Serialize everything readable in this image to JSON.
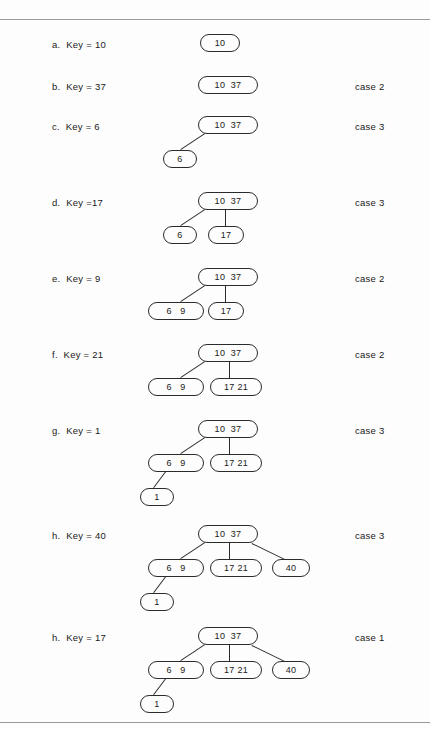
{
  "figure": {
    "type": "2-3-tree-insertion-sequence",
    "background_color": "#fdfdfd",
    "line_color": "#2b2b2b",
    "rule_color": "#9a9a9a"
  },
  "steps": [
    {
      "id": "a",
      "label": "a.  Key = 10",
      "case": "",
      "key": "10",
      "nodes": [
        {
          "name": "root",
          "text": "10",
          "x": 200,
          "y": 34,
          "w": 40
        }
      ],
      "edges": []
    },
    {
      "id": "b",
      "label": "b.  Key = 37",
      "case": "case 2",
      "key": "37",
      "nodes": [
        {
          "name": "root",
          "text": "10  37",
          "x": 198,
          "y": 76,
          "w": 60
        }
      ],
      "edges": []
    },
    {
      "id": "c",
      "label": "c.  Key = 6",
      "case": "case 3",
      "key": "6",
      "nodes": [
        {
          "name": "root",
          "text": "10  37",
          "x": 198,
          "y": 116,
          "w": 60
        },
        {
          "name": "child-left",
          "text": "6",
          "x": 163,
          "y": 150,
          "w": 34
        }
      ],
      "edges": [
        {
          "x1": 205,
          "y1": 134,
          "x2": 181,
          "y2": 150
        }
      ]
    },
    {
      "id": "d",
      "label": "d.  Key =17",
      "case": "case 3",
      "key": "17",
      "nodes": [
        {
          "name": "root",
          "text": "10  37",
          "x": 198,
          "y": 192,
          "w": 60
        },
        {
          "name": "child-left",
          "text": "6",
          "x": 163,
          "y": 226,
          "w": 34
        },
        {
          "name": "child-middle",
          "text": "17",
          "x": 208,
          "y": 226,
          "w": 36
        }
      ],
      "edges": [
        {
          "x1": 205,
          "y1": 210,
          "x2": 181,
          "y2": 226
        },
        {
          "x1": 226,
          "y1": 210,
          "x2": 226,
          "y2": 226
        }
      ]
    },
    {
      "id": "e",
      "label": "e.  Key = 9",
      "case": "case 2",
      "key": "9",
      "nodes": [
        {
          "name": "root",
          "text": "10  37",
          "x": 198,
          "y": 268,
          "w": 60
        },
        {
          "name": "child-left",
          "text": "6   9",
          "x": 148,
          "y": 302,
          "w": 56
        },
        {
          "name": "child-middle",
          "text": "17",
          "x": 208,
          "y": 302,
          "w": 36
        }
      ],
      "edges": [
        {
          "x1": 205,
          "y1": 286,
          "x2": 181,
          "y2": 302
        },
        {
          "x1": 226,
          "y1": 286,
          "x2": 226,
          "y2": 302
        }
      ]
    },
    {
      "id": "f",
      "label": "f.  Key = 21",
      "case": "case 2",
      "key": "21",
      "nodes": [
        {
          "name": "root",
          "text": "10  37",
          "x": 198,
          "y": 344,
          "w": 60
        },
        {
          "name": "child-left",
          "text": "6   9",
          "x": 148,
          "y": 378,
          "w": 56
        },
        {
          "name": "child-middle",
          "text": "17 21",
          "x": 210,
          "y": 378,
          "w": 52
        }
      ],
      "edges": [
        {
          "x1": 205,
          "y1": 362,
          "x2": 181,
          "y2": 378
        },
        {
          "x1": 230,
          "y1": 362,
          "x2": 230,
          "y2": 378
        }
      ]
    },
    {
      "id": "g",
      "label": "g.  Key = 1",
      "case": "case 3",
      "key": "1",
      "nodes": [
        {
          "name": "root",
          "text": "10  37",
          "x": 198,
          "y": 420,
          "w": 60
        },
        {
          "name": "child-left",
          "text": "6   9",
          "x": 148,
          "y": 454,
          "w": 56
        },
        {
          "name": "child-middle",
          "text": "17 21",
          "x": 210,
          "y": 454,
          "w": 52
        },
        {
          "name": "grandchild-left",
          "text": "1",
          "x": 140,
          "y": 488,
          "w": 34
        }
      ],
      "edges": [
        {
          "x1": 205,
          "y1": 438,
          "x2": 181,
          "y2": 454
        },
        {
          "x1": 230,
          "y1": 438,
          "x2": 230,
          "y2": 454
        },
        {
          "x1": 166,
          "y1": 472,
          "x2": 154,
          "y2": 488
        }
      ]
    },
    {
      "id": "h1",
      "label": "h.  Key = 40",
      "case": "case 3",
      "key": "40",
      "nodes": [
        {
          "name": "root",
          "text": "10  37",
          "x": 198,
          "y": 525,
          "w": 60
        },
        {
          "name": "child-left",
          "text": "6   9",
          "x": 148,
          "y": 559,
          "w": 56
        },
        {
          "name": "child-middle",
          "text": "17 21",
          "x": 210,
          "y": 559,
          "w": 52
        },
        {
          "name": "child-right",
          "text": "40",
          "x": 272,
          "y": 559,
          "w": 38
        },
        {
          "name": "grandchild-left",
          "text": "1",
          "x": 140,
          "y": 593,
          "w": 34
        }
      ],
      "edges": [
        {
          "x1": 205,
          "y1": 543,
          "x2": 181,
          "y2": 559
        },
        {
          "x1": 230,
          "y1": 543,
          "x2": 230,
          "y2": 559
        },
        {
          "x1": 252,
          "y1": 543,
          "x2": 285,
          "y2": 559
        },
        {
          "x1": 166,
          "y1": 577,
          "x2": 154,
          "y2": 593
        }
      ]
    },
    {
      "id": "h2",
      "label": "h.  Key = 17",
      "case": "case 1",
      "key": "17",
      "nodes": [
        {
          "name": "root",
          "text": "10  37",
          "x": 198,
          "y": 627,
          "w": 60
        },
        {
          "name": "child-left",
          "text": "6   9",
          "x": 148,
          "y": 661,
          "w": 56
        },
        {
          "name": "child-middle",
          "text": "17 21",
          "x": 210,
          "y": 661,
          "w": 52
        },
        {
          "name": "child-right",
          "text": "40",
          "x": 272,
          "y": 661,
          "w": 38
        },
        {
          "name": "grandchild-left",
          "text": "1",
          "x": 140,
          "y": 695,
          "w": 34
        }
      ],
      "edges": [
        {
          "x1": 205,
          "y1": 645,
          "x2": 181,
          "y2": 661
        },
        {
          "x1": 230,
          "y1": 645,
          "x2": 230,
          "y2": 661
        },
        {
          "x1": 252,
          "y1": 645,
          "x2": 285,
          "y2": 661
        },
        {
          "x1": 166,
          "y1": 679,
          "x2": 154,
          "y2": 695
        }
      ]
    }
  ],
  "label_rows": {
    "a": 39,
    "b": 81,
    "c": 121,
    "d": 197,
    "e": 273,
    "f": 349,
    "g": 425,
    "h1": 530,
    "h2": 632
  }
}
